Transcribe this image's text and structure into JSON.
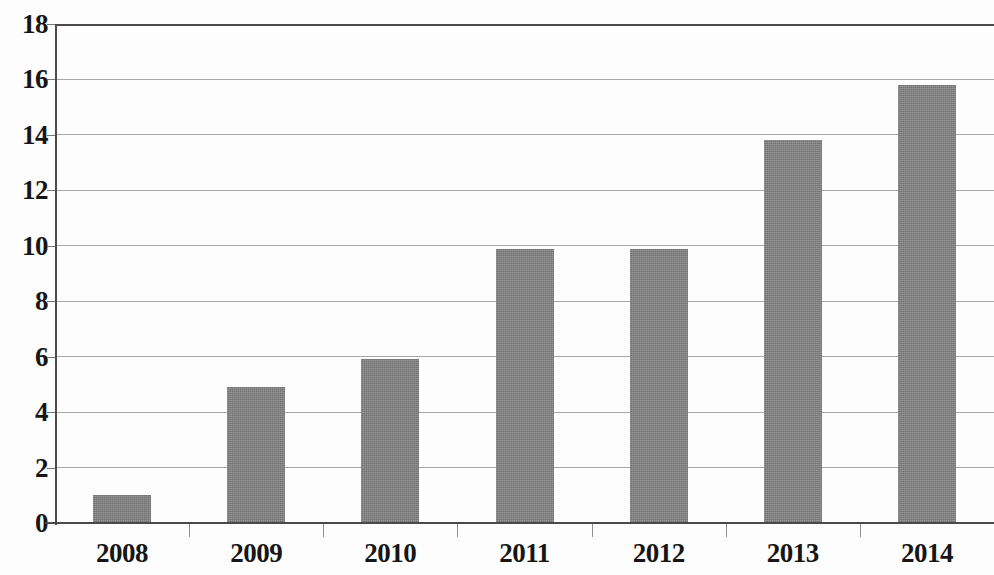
{
  "chart_data": {
    "type": "bar",
    "title": "",
    "subtitle": "",
    "xlabel": "",
    "ylabel": "",
    "categories": [
      "2008",
      "2009",
      "2010",
      "2011",
      "2012",
      "2013",
      "2014"
    ],
    "values": [
      1.0,
      4.9,
      5.9,
      9.9,
      9.9,
      13.8,
      15.8
    ],
    "series": [
      {
        "name": "",
        "values": [
          1.0,
          4.9,
          5.9,
          9.9,
          9.9,
          13.8,
          15.8
        ]
      }
    ],
    "ylim": [
      0,
      18
    ],
    "y_ticks": [
      0,
      2,
      4,
      6,
      8,
      10,
      12,
      14,
      16,
      18
    ],
    "y_tick_labels": [
      "0",
      "2",
      "4",
      "6",
      "8",
      "10",
      "12",
      "14",
      "16",
      "18"
    ],
    "x_tick_labels": [
      "2008",
      "2009",
      "2010",
      "2011",
      "2012",
      "2013",
      "2014"
    ],
    "grid": true,
    "grid_axis": "y",
    "legend": false,
    "legend_position": "none",
    "annotations": [],
    "colors": {
      "bar_fill": "#808080",
      "gridline": "#a8a8a8",
      "axis_line": "#4a4a4a",
      "tick_label": "#161616",
      "background": "#fdfdfd"
    }
  }
}
